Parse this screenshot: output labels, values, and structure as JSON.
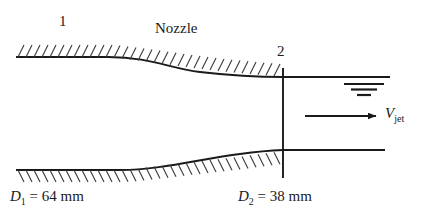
{
  "figure": {
    "background_color": "#ffffff",
    "line_color": "#1a1a1a"
  },
  "labels": {
    "section_1": "1",
    "section_2": "2",
    "nozzle": "Nozzle",
    "d1_symbol": "D",
    "d1_sub": "1",
    "d1_value": "= 64 mm",
    "d2_symbol": "D",
    "d2_sub": "2",
    "d2_value": "= 38 mm",
    "velocity_symbol": "V",
    "velocity_sub": "jet"
  },
  "geometry": {
    "upper_wall_inlet_y": 57,
    "upper_wall_outlet_y": 77,
    "lower_wall_inlet_y": 170,
    "lower_wall_outlet_y": 150,
    "wall_left_x": 16,
    "contraction_start_x": 108,
    "section2_x": 283,
    "jet_end_x": 390,
    "inlet_diameter_mm": 64,
    "outlet_diameter_mm": 38
  },
  "annotations": {
    "free_surface_symbol": "three-stacked-bars",
    "velocity_arrow_direction": "right",
    "hatch_style": "diagonal-ticks-up-right"
  }
}
